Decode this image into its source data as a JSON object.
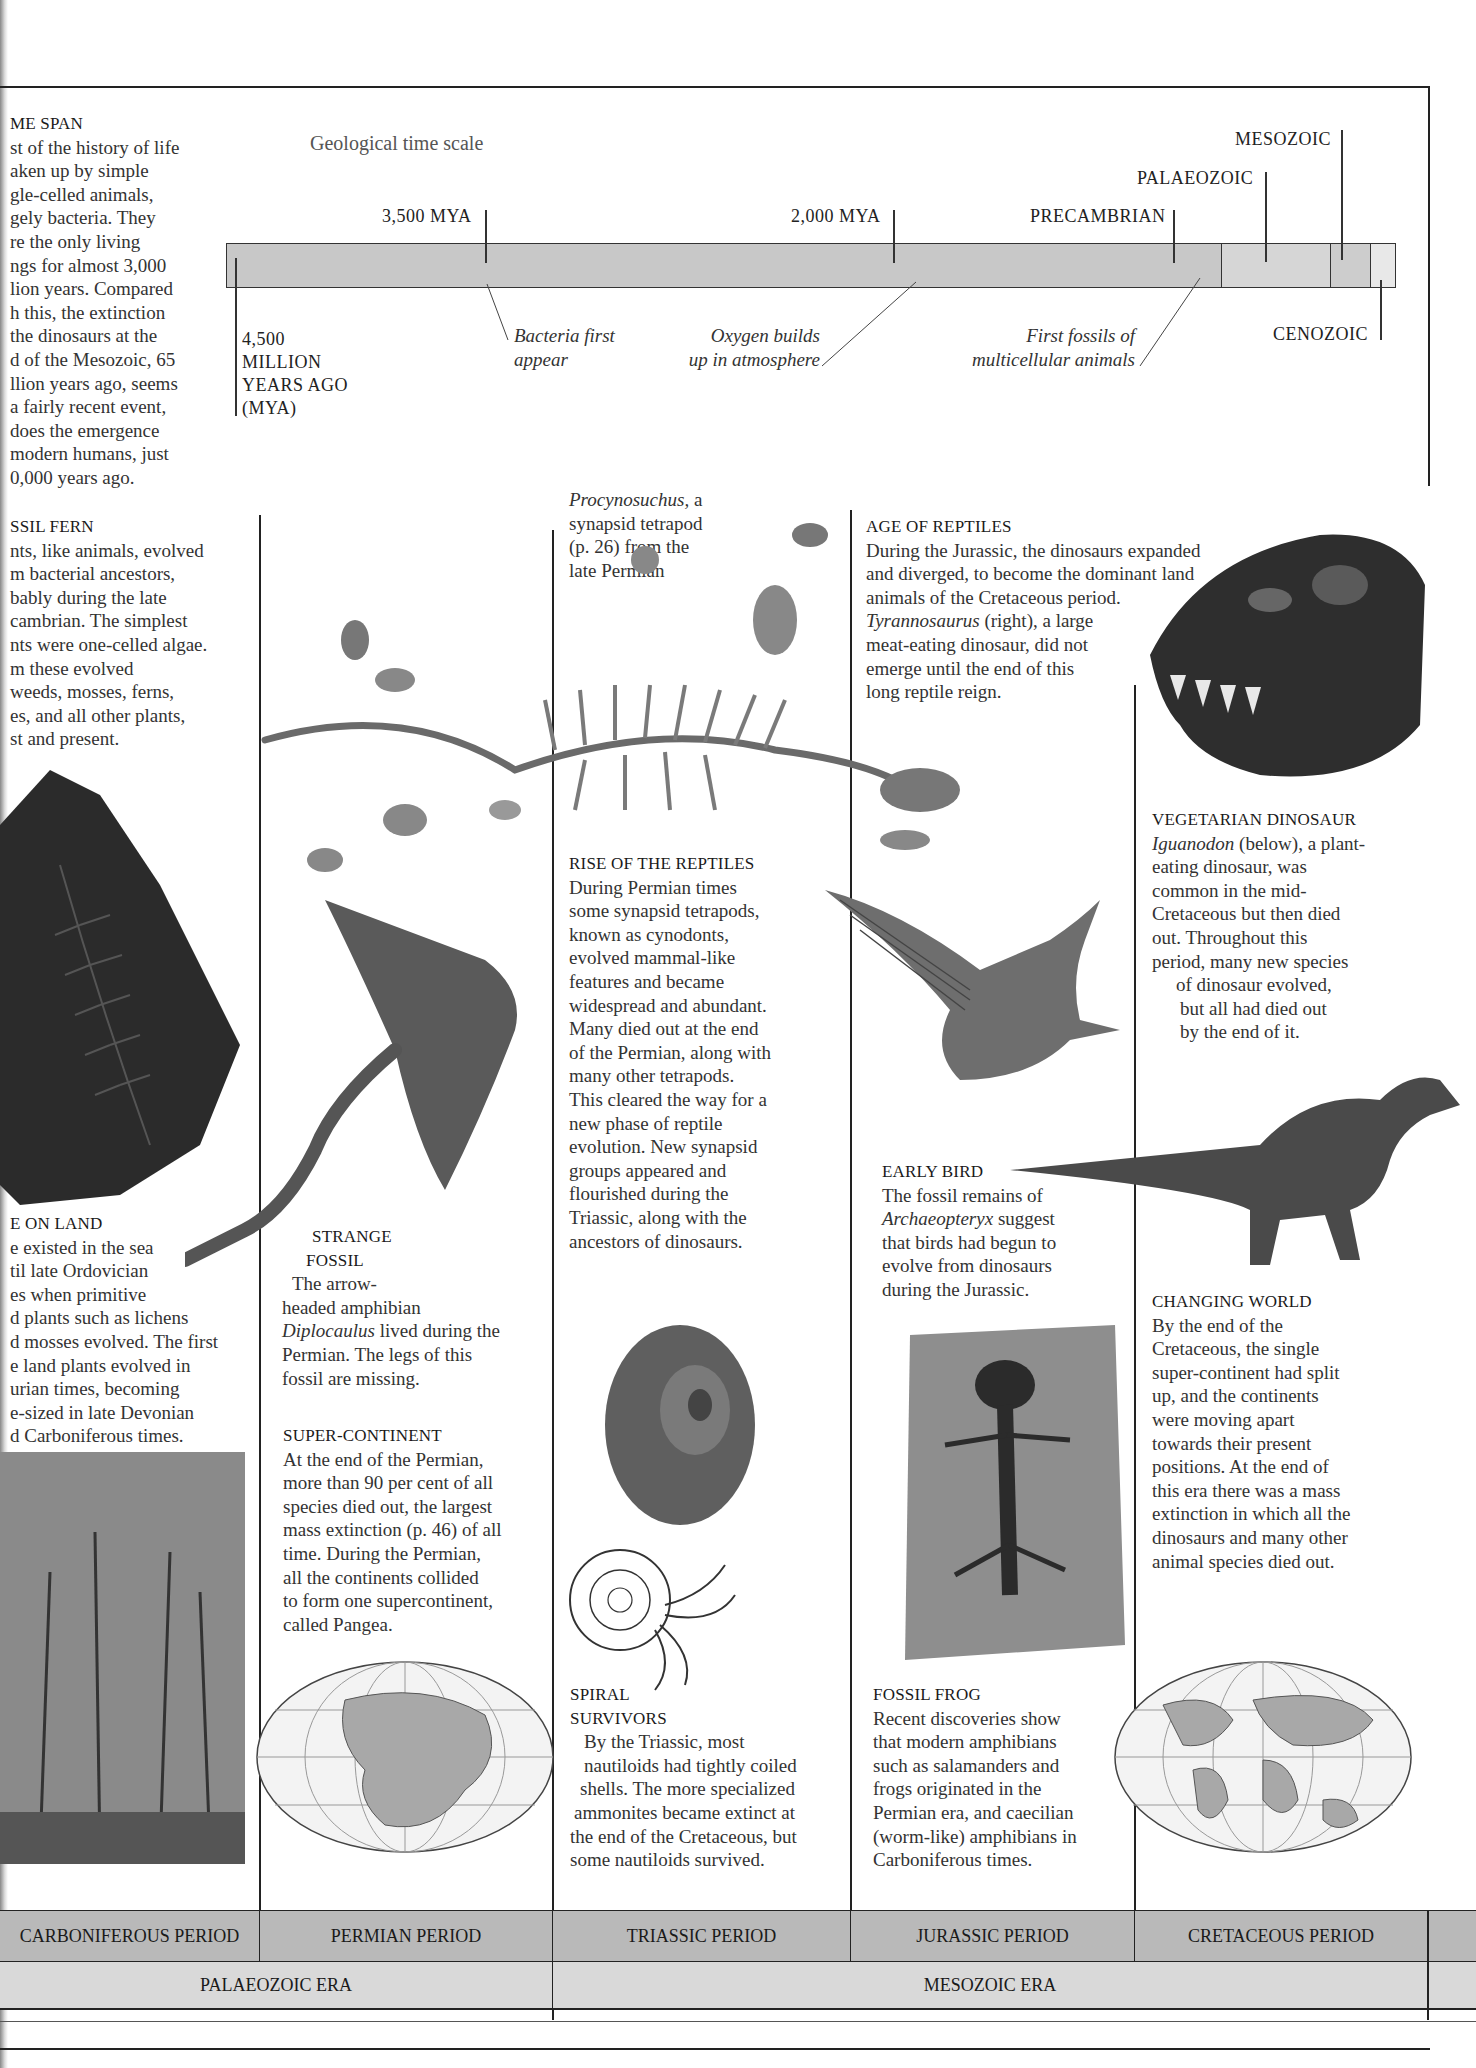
{
  "timeline": {
    "title": "Geological time scale",
    "start_label": [
      "4,500",
      "MILLION",
      "YEARS AGO",
      "(MYA)"
    ],
    "ticks": [
      {
        "label": "3,500 MYA"
      },
      {
        "label": "2,000 MYA"
      },
      {
        "label": "PRECAMBRIAN"
      },
      {
        "label": "PALAEOZOIC"
      },
      {
        "label": "MESOZOIC"
      },
      {
        "label": "CENOZOIC"
      }
    ],
    "events": [
      {
        "label": "Bacteria first appear",
        "lines": [
          "Bacteria first",
          "appear"
        ]
      },
      {
        "label": "Oxygen builds up in atmosphere",
        "lines": [
          "Oxygen builds",
          "up in atmosphere"
        ]
      },
      {
        "label": "First fossils of multicellular animals",
        "lines": [
          "First fossils of",
          "multicellular animals"
        ]
      }
    ],
    "colors": {
      "precambrian": "#c8c8c8",
      "palaeozoic": "#d4d4d4",
      "mesozoic": "#cccccc",
      "cenozoic": "#e6e6e6"
    }
  },
  "sections": {
    "time_span": {
      "heading": "ME SPAN",
      "lines": [
        "st of the history of life",
        "aken up by simple",
        "gle-celled animals,",
        "gely bacteria. They",
        "re the only living",
        "ngs for almost 3,000",
        "lion years. Compared",
        "h this, the extinction",
        "the dinosaurs at the",
        "d of the Mesozoic, 65",
        "llion years ago, seems",
        "a fairly recent event,",
        "does the emergence",
        "modern humans, just",
        "0,000 years ago."
      ]
    },
    "fossil_fern": {
      "heading": "SSIL FERN",
      "lines": [
        "nts, like animals, evolved",
        "m bacterial ancestors,",
        "bably during the late",
        "cambrian. The simplest",
        "nts were one-celled algae.",
        "m these evolved",
        "weeds, mosses, ferns,",
        "es, and all other plants,",
        "st and present."
      ]
    },
    "procynosuchus": {
      "lines_italic": "Procynosuchus,",
      "lines": [
        " a",
        "synapsid tetrapod",
        "(p. 26) from the",
        "late Permian"
      ]
    },
    "age_of_reptiles": {
      "heading": "AGE OF REPTILES",
      "lines": [
        "During the Jurassic, the dinosaurs expanded",
        "and diverged, to become the dominant land",
        "animals of the Cretaceous period."
      ],
      "italic": "Tyrannosaurus",
      "lines2": [
        " (right), a large",
        "meat-eating dinosaur, did not",
        "emerge until the end of this",
        "long reptile reign."
      ]
    },
    "vegetarian_dinosaur": {
      "heading": "VEGETARIAN DINOSAUR",
      "italic": "Iguanodon",
      "first_rest": " (below), a plant-",
      "lines": [
        "eating dinosaur, was",
        "common in the mid-",
        "Cretaceous but then died",
        "out. Throughout this",
        "period, many new species",
        "of dinosaur evolved,",
        "but all had died out",
        "by the end of it."
      ]
    },
    "rise_of_reptiles": {
      "heading": "RISE OF THE REPTILES",
      "lines": [
        "During Permian times",
        "some synapsid tetrapods,",
        "known as cynodonts,",
        "evolved mammal-like",
        "features and became",
        "widespread and abundant.",
        "Many died out at the end",
        "of the Permian, along with",
        "many other tetrapods.",
        "This cleared the way for a",
        "new phase of reptile",
        "evolution. New synapsid",
        "groups appeared and",
        "flourished during the",
        "Triassic, along with the",
        "ancestors of dinosaurs."
      ]
    },
    "life_on_land": {
      "heading": "E ON LAND",
      "lines": [
        "e existed in the sea",
        "til late Ordovician",
        "es when primitive",
        "d plants such as lichens",
        "d mosses evolved. The first",
        "e land plants evolved in",
        "urian times, becoming",
        "e-sized in late Devonian",
        "d Carboniferous times."
      ]
    },
    "strange_fossil": {
      "heading": [
        "STRANGE",
        "FOSSIL"
      ],
      "lines": [
        "The arrow-",
        "headed amphibian"
      ],
      "italic": "Diplocaulus",
      "rest": " lived during the",
      "lines2": [
        "Permian. The legs of this",
        "fossil are missing."
      ]
    },
    "early_bird": {
      "heading": "EARLY BIRD",
      "line1": "The fossil remains of",
      "italic": "Archaeopteryx",
      "rest": " suggest",
      "lines": [
        "that birds had begun to",
        "evolve from dinosaurs",
        "during the Jurassic."
      ]
    },
    "changing_world": {
      "heading": "CHANGING WORLD",
      "lines": [
        "By the end of the",
        "Cretaceous, the single",
        "super-continent had split",
        "up, and the continents",
        "were moving apart",
        "towards their present",
        "positions. At the end of",
        "this era there was a mass",
        "extinction in which all the",
        "dinosaurs and many other",
        "animal species died out."
      ]
    },
    "super_continent": {
      "heading": "SUPER-CONTINENT",
      "lines": [
        "At the end of the Permian,",
        "more than 90 per cent of all",
        "species died out, the largest",
        "mass extinction (p. 46) of all",
        "time. During the Permian,",
        "all the continents collided",
        "to form one supercontinent,",
        "called Pangea."
      ]
    },
    "spiral_survivors": {
      "heading": [
        "SPIRAL",
        "SURVIVORS"
      ],
      "lines": [
        "By the Triassic, most",
        "nautiloids had tightly coiled",
        "shells. The more specialized",
        "ammonites became extinct at",
        "the end of the Cretaceous, but",
        "some nautiloids survived."
      ]
    },
    "fossil_frog": {
      "heading": "FOSSIL FROG",
      "lines": [
        "Recent discoveries show",
        "that modern amphibians",
        "such as salamanders and",
        "frogs originated in the",
        "Permian era, and caecilian",
        "(worm-like) amphibians in",
        "Carboniferous times."
      ]
    }
  },
  "periods": [
    "CARBONIFEROUS PERIOD",
    "PERMIAN PERIOD",
    "TRIASSIC PERIOD",
    "JURASSIC PERIOD",
    "CRETACEOUS PERIOD"
  ],
  "eras": [
    "PALAEOZOIC ERA",
    "MESOZOIC ERA"
  ],
  "colors": {
    "period_band": "#b9b9b9",
    "era_band": "#d9d9d9",
    "rule": "#222222"
  }
}
